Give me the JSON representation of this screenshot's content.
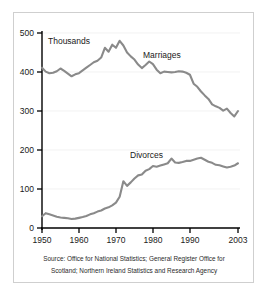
{
  "frame": {
    "border_color": "#cfcfcf",
    "background": "#ffffff"
  },
  "axis": {
    "y_ticks": [
      "0",
      "100",
      "200",
      "300",
      "400",
      "500"
    ],
    "x_ticks": [
      "1950",
      "1960",
      "1970",
      "1980",
      "1990",
      "2003"
    ],
    "unit_note": "Thousands"
  },
  "annotations": {
    "marriages": "Marriages",
    "divorces": "Divorces"
  },
  "source": {
    "line1": "Source: Office for National Statistics; General Register Office for",
    "line2": "Scotland; Northern Ireland Statistics and Research Agency"
  },
  "chart_data": {
    "type": "line",
    "title": "",
    "subtitle": "",
    "xlabel": "",
    "ylabel": "Thousands",
    "xlim": [
      1950,
      2003
    ],
    "ylim": [
      0,
      500
    ],
    "grid": true,
    "legend": "inline-labels",
    "line_color": "#8a8a8a",
    "x": [
      1950,
      1951,
      1952,
      1953,
      1954,
      1955,
      1956,
      1957,
      1958,
      1959,
      1960,
      1961,
      1962,
      1963,
      1964,
      1965,
      1966,
      1967,
      1968,
      1969,
      1970,
      1971,
      1972,
      1973,
      1974,
      1975,
      1976,
      1977,
      1978,
      1979,
      1980,
      1981,
      1982,
      1983,
      1984,
      1985,
      1986,
      1987,
      1988,
      1989,
      1990,
      1991,
      1992,
      1993,
      1994,
      1995,
      1996,
      1997,
      1998,
      1999,
      2000,
      2001,
      2002,
      2003
    ],
    "series": [
      {
        "name": "Marriages",
        "values": [
          411,
          401,
          397,
          398,
          402,
          409,
          403,
          396,
          389,
          394,
          397,
          404,
          411,
          418,
          425,
          429,
          437,
          462,
          452,
          470,
          462,
          480,
          468,
          450,
          440,
          432,
          419,
          410,
          418,
          427,
          420,
          406,
          397,
          401,
          400,
          399,
          400,
          402,
          401,
          398,
          393,
          370,
          362,
          350,
          340,
          331,
          317,
          312,
          308,
          301,
          306,
          295,
          286,
          300
        ]
      },
      {
        "name": "Divorces",
        "values": [
          30,
          38,
          35,
          32,
          29,
          27,
          26,
          25,
          23,
          24,
          26,
          28,
          31,
          35,
          38,
          42,
          45,
          50,
          53,
          58,
          65,
          80,
          120,
          108,
          117,
          127,
          135,
          137,
          147,
          151,
          159,
          157,
          160,
          163,
          166,
          178,
          168,
          167,
          169,
          172,
          172,
          175,
          178,
          180,
          175,
          170,
          167,
          162,
          161,
          158,
          155,
          157,
          160,
          166
        ]
      }
    ],
    "notes": {
      "marriages_peak": {
        "year": 1972,
        "value": 480
      },
      "marriages_end": {
        "year": 2003,
        "value": 300
      },
      "divorces_spike_year": 1972,
      "divorces_end": {
        "year": 2003,
        "value": 166
      }
    }
  }
}
